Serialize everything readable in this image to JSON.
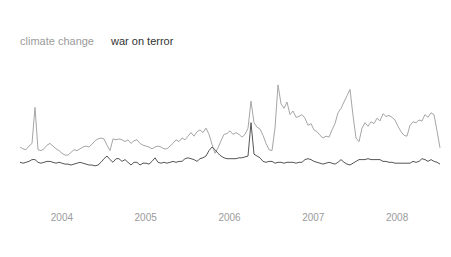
{
  "legend": {
    "items": [
      {
        "label": "climate change",
        "color": "#9b9b9b"
      },
      {
        "label": "war on terror",
        "color": "#333333"
      }
    ]
  },
  "x_axis": {
    "label_color": "#9b9b9b"
  },
  "colors": {
    "background": "#ffffff",
    "climate_change_line": "#a6a6a6",
    "war_on_terror_line": "#565656"
  },
  "chart_data": {
    "type": "line",
    "title": "",
    "xlabel": "",
    "ylabel": "",
    "grid": false,
    "y_axis_visible": false,
    "legend_position": "top-left",
    "x_axis_ticks": [
      2004,
      2005,
      2006,
      2007,
      2008
    ],
    "x_start_year": 2004.0,
    "x_step_years": 0.0358,
    "x_range_years": [
      2004.0,
      2009.0
    ],
    "y_range": [
      0,
      100
    ],
    "series": [
      {
        "name": "climate change",
        "color": "#a6a6a6",
        "values": [
          30,
          28,
          27,
          31,
          34,
          74,
          27,
          26,
          28,
          32,
          34,
          31,
          28,
          26,
          23,
          21,
          21,
          24,
          27,
          26,
          28,
          30,
          31,
          30,
          33,
          37,
          39,
          40,
          39,
          32,
          26,
          39,
          38,
          39,
          38,
          36,
          38,
          34,
          37,
          38,
          34,
          32,
          31,
          30,
          28,
          30,
          31,
          30,
          28,
          28,
          31,
          34,
          38,
          36,
          40,
          38,
          42,
          46,
          42,
          47,
          49,
          46,
          51,
          44,
          33,
          23,
          29,
          37,
          44,
          45,
          48,
          44,
          46,
          44,
          41,
          44,
          51,
          81,
          57,
          52,
          50,
          43,
          34,
          27,
          26,
          51,
          99,
          78,
          73,
          80,
          66,
          70,
          63,
          64,
          66,
          62,
          54,
          56,
          49,
          47,
          43,
          40,
          42,
          41,
          49,
          56,
          68,
          73,
          80,
          87,
          94,
          65,
          40,
          36,
          51,
          57,
          53,
          58,
          56,
          62,
          59,
          67,
          64,
          65,
          63,
          60,
          53,
          47,
          43,
          42,
          54,
          58,
          57,
          60,
          59,
          66,
          63,
          68,
          66,
          48,
          29
        ]
      },
      {
        "name": "war on terror",
        "color": "#565656",
        "values": [
          13,
          12,
          13,
          14,
          16,
          16,
          13,
          12,
          13,
          14,
          14,
          13,
          12,
          13,
          12,
          11,
          11,
          10,
          11,
          12,
          13,
          12,
          11,
          10,
          10,
          9,
          10,
          13,
          17,
          20,
          16,
          13,
          17,
          17,
          14,
          16,
          13,
          10,
          13,
          13,
          10,
          12,
          12,
          11,
          14,
          18,
          13,
          12,
          13,
          12,
          13,
          14,
          13,
          14,
          14,
          17,
          18,
          17,
          16,
          14,
          17,
          18,
          20,
          26,
          30,
          27,
          23,
          20,
          18,
          17,
          17,
          17,
          17,
          18,
          18,
          19,
          20,
          57,
          22,
          20,
          18,
          14,
          13,
          14,
          14,
          12,
          13,
          13,
          12,
          13,
          13,
          13,
          12,
          13,
          13,
          16,
          17,
          16,
          14,
          13,
          12,
          11,
          12,
          13,
          12,
          11,
          13,
          16,
          13,
          11,
          10,
          12,
          14,
          16,
          16,
          16,
          17,
          16,
          16,
          16,
          16,
          14,
          14,
          13,
          13,
          12,
          12,
          12,
          12,
          12,
          12,
          14,
          13,
          14,
          17,
          16,
          14,
          16,
          14,
          13,
          11
        ]
      }
    ]
  }
}
